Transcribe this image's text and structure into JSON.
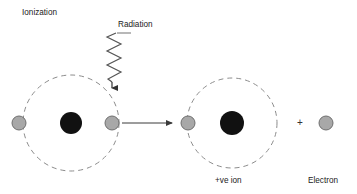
{
  "diagram": {
    "labels": {
      "ionization": "Ionization",
      "radiation": "Radiation",
      "positive_ion": "+ve ion",
      "electron": "Electron",
      "plus": "+"
    },
    "colors": {
      "nucleus": "#111111",
      "electron_fill": "#a8a8a8",
      "electron_stroke": "#6f6f6f",
      "orbit_stroke": "#8c8c8c",
      "arrow_stroke": "#3a3a3a",
      "radiation_stroke": "#555555",
      "text": "#222222",
      "background": "#ffffff"
    },
    "atoms": [
      {
        "name": "neutral-atom",
        "cx": 71,
        "cy": 123,
        "orbit_radius": 48,
        "nucleus_radius": 11,
        "electrons": [
          {
            "name": "bound-electron-left",
            "cx": 19,
            "cy": 123,
            "r": 7
          },
          {
            "name": "struck-electron",
            "cx": 112,
            "cy": 123,
            "r": 7
          }
        ],
        "caption": ""
      },
      {
        "name": "positive-ion-atom",
        "cx": 232,
        "cy": 123,
        "orbit_radius": 45,
        "nucleus_radius": 12,
        "electrons": [
          {
            "name": "bound-electron-left",
            "cx": 188,
            "cy": 123,
            "r": 7
          }
        ],
        "caption": "+ve ion"
      }
    ],
    "free_electron": {
      "name": "free-electron",
      "cx": 326,
      "cy": 123,
      "r": 7,
      "caption": "Electron"
    },
    "radiation_wave": {
      "name": "radiation-wave",
      "x_center": 114,
      "y_top": 33,
      "y_bottom": 82,
      "amplitude": 7,
      "cycles": 7,
      "arrow_tip": {
        "x": 112,
        "y": 93
      },
      "tick": {
        "x1": 117,
        "y1": 33,
        "x2": 131,
        "y2": 33
      }
    },
    "ejection_arrow": {
      "name": "electron-ejection-arrow",
      "x1": 122,
      "y1": 123,
      "x2": 176,
      "y2": 123
    },
    "label_positions": {
      "ionization": {
        "x": 22,
        "y": 15
      },
      "radiation": {
        "x": 118,
        "y": 27
      },
      "positive_ion": {
        "x": 215,
        "y": 183
      },
      "electron": {
        "x": 308,
        "y": 183
      },
      "plus": {
        "x": 297,
        "y": 125
      }
    }
  }
}
